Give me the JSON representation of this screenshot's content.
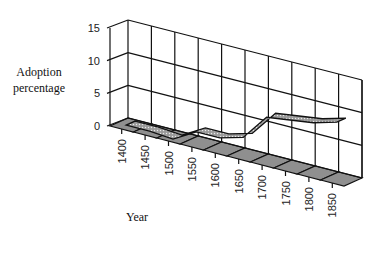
{
  "chart_data": {
    "type": "area",
    "style": "3d-ribbon",
    "title": "",
    "xlabel": "Year",
    "ylabel": "Adoption percentage",
    "categories": [
      "1400",
      "1450",
      "1500",
      "1550",
      "1600",
      "1650",
      "1700",
      "1750",
      "1800",
      "1850"
    ],
    "series": [
      {
        "name": "Adoption percentage",
        "values": [
          0.3,
          0.3,
          0,
          2,
          2,
          3,
          7,
          7.5,
          8,
          9
        ]
      }
    ],
    "yticks": [
      "0",
      "5",
      "10",
      "15"
    ],
    "ylim": [
      0,
      15
    ],
    "grid": true,
    "legend": "none",
    "colors": {
      "ribbon": "#8a8a8a",
      "floor": "#8f8f8f",
      "grid": "#111111"
    }
  },
  "labels": {
    "ylabel_line1": "Adoption",
    "ylabel_line2": "percentage",
    "xlabel": "Year"
  }
}
